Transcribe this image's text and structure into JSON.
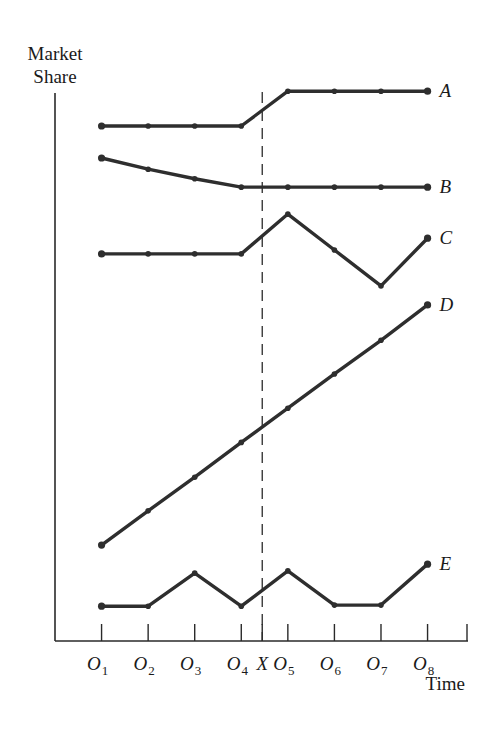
{
  "chart_data": {
    "type": "line",
    "title": "",
    "ylabel_lines": [
      "Market",
      "Share"
    ],
    "xlabel": "Time",
    "x_ticks": [
      {
        "letter": "O",
        "sub": "1",
        "pos": 1
      },
      {
        "letter": "O",
        "sub": "2",
        "pos": 2
      },
      {
        "letter": "O",
        "sub": "3",
        "pos": 3
      },
      {
        "letter": "O",
        "sub": "4",
        "pos": 4
      },
      {
        "letter": "X",
        "sub": "",
        "pos": 4.45
      },
      {
        "letter": "O",
        "sub": "5",
        "pos": 5
      },
      {
        "letter": "O",
        "sub": "6",
        "pos": 6
      },
      {
        "letter": "O",
        "sub": "7",
        "pos": 7
      },
      {
        "letter": "O",
        "sub": "8",
        "pos": 8
      }
    ],
    "x": [
      1,
      2,
      3,
      4,
      5,
      6,
      7,
      8
    ],
    "xlim": [
      0,
      9.05
    ],
    "ylim": [
      0,
      100
    ],
    "y_units": "relative (no numeric scale shown)",
    "intervention": {
      "label": "X",
      "pos": 4.45,
      "style": "dashed"
    },
    "grid": false,
    "legend": "none (series labelled at right end of lines)",
    "series": [
      {
        "name": "A",
        "values": [
          91.8,
          91.8,
          91.8,
          91.8,
          98.0,
          98.0,
          98.0,
          98.0
        ]
      },
      {
        "name": "B",
        "values": [
          86.1,
          84.1,
          82.4,
          80.9,
          80.9,
          80.9,
          80.9,
          80.9
        ]
      },
      {
        "name": "C",
        "values": [
          69.0,
          69.0,
          69.0,
          69.0,
          76.1,
          69.7,
          63.3,
          71.8
        ]
      },
      {
        "name": "D",
        "values": [
          17.1,
          23.2,
          29.2,
          35.4,
          41.5,
          47.6,
          53.6,
          59.9
        ]
      },
      {
        "name": "E",
        "values": [
          6.2,
          6.2,
          12.1,
          6.2,
          12.5,
          6.4,
          6.4,
          13.7
        ]
      }
    ],
    "colors": {
      "ink": "#2e2e2e",
      "background": "#ffffff"
    }
  }
}
